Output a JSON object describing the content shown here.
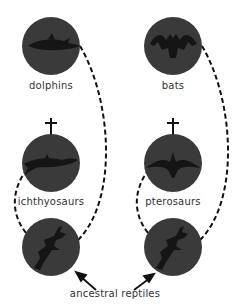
{
  "diagram": {
    "topic": "convergent evolution",
    "nodes": [
      {
        "id": "dolphins",
        "label": "dolphins",
        "extinct": false
      },
      {
        "id": "bats",
        "label": "bats",
        "extinct": false
      },
      {
        "id": "ichthyosaurs",
        "label": "ichthyosaurs",
        "extinct": true
      },
      {
        "id": "pterosaurs",
        "label": "pterosaurs",
        "extinct": true
      },
      {
        "id": "reptile-left",
        "label": "",
        "extinct": false
      },
      {
        "id": "reptile-right",
        "label": "",
        "extinct": false
      }
    ],
    "ancestor_label": "ancestral reptiles",
    "extinct_symbol": "†",
    "colors": {
      "circle": "#3a3a3a",
      "silhouette": "#151515",
      "line": "#111111",
      "text": "#333333"
    }
  }
}
